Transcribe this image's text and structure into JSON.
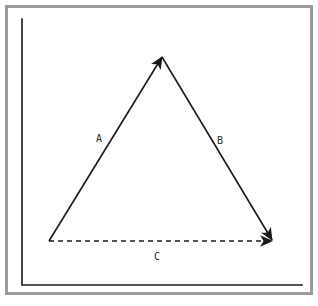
{
  "figure": {
    "background_color": "#ffffff",
    "frame": {
      "border_color": "#9a9a9a",
      "border_width_px": 3,
      "inset_px": 5
    },
    "axis": {
      "name": "L-shaped coordinate axis",
      "color": "#1a1a1a",
      "line_width_px": 1.6,
      "vertical": {
        "x": 22,
        "y_top": 19,
        "y_bottom": 285
      },
      "horizontal": {
        "y": 285,
        "x_left": 22,
        "x_right": 302
      }
    },
    "stroke_color": "#1a1a1a",
    "vectors": [
      {
        "id": "A",
        "label": "A",
        "style": "solid",
        "label_x": 99,
        "label_y": 139,
        "start_x": 49,
        "start_y": 241,
        "end_x": 162,
        "end_y": 57,
        "arrowhead": "end",
        "line_width_px": 1.6
      },
      {
        "id": "B",
        "label": "B",
        "style": "solid",
        "label_x": 220,
        "label_y": 141,
        "start_x": 162,
        "start_y": 57,
        "end_x": 272,
        "end_y": 240,
        "arrowhead": "end",
        "line_width_px": 1.6
      },
      {
        "id": "C",
        "label": "C",
        "style": "dashed",
        "dash_pattern": "5,4",
        "label_x": 157,
        "label_y": 257,
        "start_x": 49,
        "start_y": 241,
        "end_x": 272,
        "end_y": 241,
        "arrowhead": "end",
        "line_width_px": 1.6
      }
    ]
  }
}
